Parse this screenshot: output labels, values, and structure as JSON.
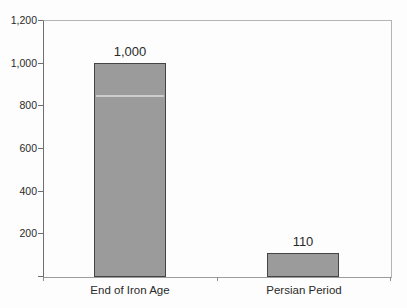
{
  "chart_data": {
    "type": "bar",
    "title": "",
    "categories": [
      "End of Iron Age",
      "Persian Period"
    ],
    "values": [
      1000,
      110
    ],
    "bar_value_labels": [
      "1,000",
      "110"
    ],
    "xlabel": "",
    "ylabel": "",
    "ylim": [
      0,
      1200
    ],
    "ytick_step": 200,
    "yticks": [
      {
        "value": 1200,
        "label": "1,200"
      },
      {
        "value": 1000,
        "label": "1,000"
      },
      {
        "value": 800,
        "label": "800"
      },
      {
        "value": 600,
        "label": "600"
      },
      {
        "value": 400,
        "label": "400"
      },
      {
        "value": 200,
        "label": "200"
      }
    ],
    "grid": false,
    "legend": "none",
    "colors": {
      "bar_fill": "#9b9b9b",
      "bar_border": "#444444",
      "y_axis": "#6f6f6f",
      "x_axis": "#9c9c9c",
      "plot_border": "#b4b4b4",
      "text": "#2a2a2a",
      "background": "#fdfdfd"
    }
  }
}
